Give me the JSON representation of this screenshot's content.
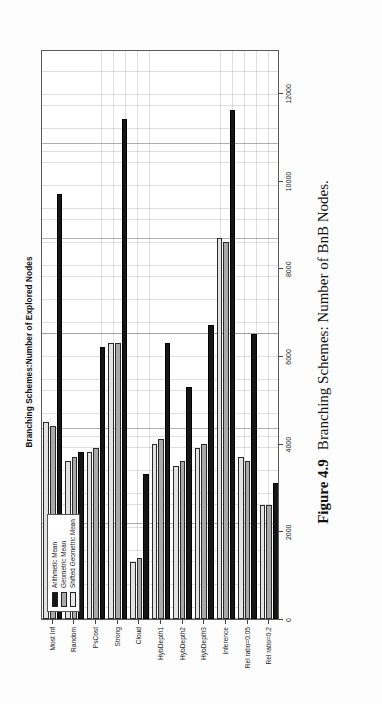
{
  "figure": {
    "number": "Figure 4.9",
    "caption": "Branching Schemes: Number of BnB Nodes."
  },
  "legend": {
    "position": "top-left",
    "entries": [
      {
        "label": "Arithmetic Mean",
        "color": "#161616"
      },
      {
        "label": "Geometric Mean",
        "color": "#a9a9a9"
      },
      {
        "label": "Shifted Geometric Mean",
        "color": "#e8e8e8"
      }
    ]
  },
  "chart_data": {
    "type": "bar",
    "orientation": "horizontal",
    "title": "Branching Schemes:Number of Explored Nodes",
    "xlabel": "",
    "ylabel": "",
    "grid": true,
    "xlim": [
      0,
      13000
    ],
    "xticks": [
      0,
      2000,
      4000,
      6000,
      8000,
      10000,
      12000
    ],
    "xticklabels": [
      "0",
      "2000",
      "4000",
      "6000",
      "8000",
      "10000",
      "12000"
    ],
    "categories": [
      "Most Inf",
      "Random",
      "PsCost",
      "Strong",
      "Cloud",
      "HybDepth1",
      "HybDepth2",
      "HybDepth3",
      "Inference",
      "Rel ratio=0.05",
      "Rel ratio=0.2"
    ],
    "series": [
      {
        "name": "Arithmetic Mean",
        "color": "#161616",
        "values": [
          9700,
          3800,
          6200,
          11400,
          3300,
          6300,
          5300,
          6700,
          11600,
          6500,
          3100
        ]
      },
      {
        "name": "Geometric Mean",
        "color": "#a9a9a9",
        "values": [
          4400,
          3700,
          3900,
          6300,
          1400,
          4100,
          3600,
          4000,
          8600,
          3600,
          2600
        ]
      },
      {
        "name": "Shifted Geometric Mean",
        "color": "#e2e2e2",
        "values": [
          4500,
          3600,
          3800,
          6300,
          1300,
          4000,
          3500,
          3900,
          8700,
          3700,
          2600
        ]
      }
    ]
  }
}
